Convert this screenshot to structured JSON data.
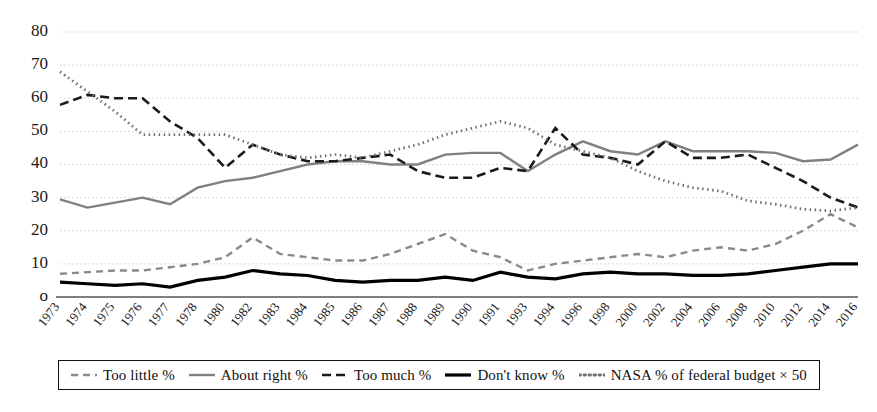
{
  "chart_data": {
    "type": "line",
    "title": "",
    "subtitle": "",
    "xlabel": "",
    "ylabel": "",
    "ylim": [
      0,
      80
    ],
    "yticks": [
      0,
      10,
      20,
      30,
      40,
      50,
      60,
      70,
      80
    ],
    "ytick_labels": [
      "o",
      "10",
      "20",
      "30",
      "40",
      "50",
      "60",
      "70",
      "80"
    ],
    "grid": true,
    "legend_position": "bottom",
    "categories": [
      "1973",
      "1974",
      "1975",
      "1976",
      "1977",
      "1978",
      "1980",
      "1982",
      "1983",
      "1984",
      "1985",
      "1986",
      "1987",
      "1988",
      "1989",
      "1990",
      "1991",
      "1993",
      "1994",
      "1996",
      "1998",
      "2000",
      "2002",
      "2004",
      "2006",
      "2008",
      "2010",
      "2012",
      "2014",
      "2016"
    ],
    "series": [
      {
        "name": "Too little %",
        "style": "dashed",
        "color": "#8a8a8a",
        "width": 2.4,
        "dash": "7,5",
        "values": [
          7,
          7.5,
          8,
          8,
          9,
          10,
          12,
          18,
          13,
          12,
          11,
          11,
          13,
          16,
          19,
          14,
          12,
          8,
          10,
          11,
          12,
          13,
          12,
          14,
          15,
          14,
          16,
          20,
          25,
          21
        ]
      },
      {
        "name": "About right %",
        "style": "solid",
        "color": "#808080",
        "width": 2.4,
        "dash": "",
        "values": [
          29.5,
          27,
          28.5,
          30,
          28,
          33,
          35,
          36,
          38,
          40,
          41,
          41,
          40,
          40,
          43,
          43.5,
          43.5,
          38,
          43,
          47,
          44,
          43,
          47,
          44,
          44,
          44,
          43.5,
          41,
          41.5,
          46
        ]
      },
      {
        "name": "Too much %",
        "style": "dashed",
        "color": "#1a1a1a",
        "width": 2.6,
        "dash": "9,5",
        "values": [
          58,
          61,
          60,
          60,
          53,
          48,
          39,
          46,
          43,
          41,
          41,
          42,
          43,
          38,
          36,
          36,
          39,
          38,
          51,
          43,
          42,
          40,
          47,
          42,
          42,
          43,
          39,
          35,
          30,
          27
        ]
      },
      {
        "name": "Don't know %",
        "style": "solid",
        "color": "#000000",
        "width": 3.2,
        "dash": "",
        "values": [
          4.5,
          4,
          3.5,
          4,
          3,
          5,
          6,
          8,
          7,
          6.5,
          5,
          4.5,
          5,
          5,
          6,
          5,
          7.5,
          6,
          5.5,
          7,
          7.5,
          7,
          7,
          6.5,
          6.5,
          7,
          8,
          9,
          10,
          10
        ]
      },
      {
        "name": "NASA % of federal budget × 50",
        "style": "dotted",
        "color": "#707070",
        "width": 2.8,
        "dash": "1.5,3.5",
        "values": [
          68,
          62,
          56,
          49,
          49,
          49,
          49,
          46,
          43,
          42,
          43,
          42,
          44,
          46,
          49,
          51,
          53,
          51,
          46,
          44,
          42,
          38,
          35,
          33,
          32,
          29,
          28,
          26.5,
          26,
          27
        ]
      }
    ]
  },
  "legend": {
    "items": [
      {
        "label": "Too little %",
        "marker": "dashed-gray-line-icon"
      },
      {
        "label": "About right %",
        "marker": "solid-gray-line-icon"
      },
      {
        "label": "Too much %",
        "marker": "dashed-black-line-icon"
      },
      {
        "label": "Don't know %",
        "marker": "solid-black-line-icon"
      },
      {
        "label": "NASA % of federal budget × 50",
        "marker": "dotted-gray-line-icon"
      }
    ]
  }
}
